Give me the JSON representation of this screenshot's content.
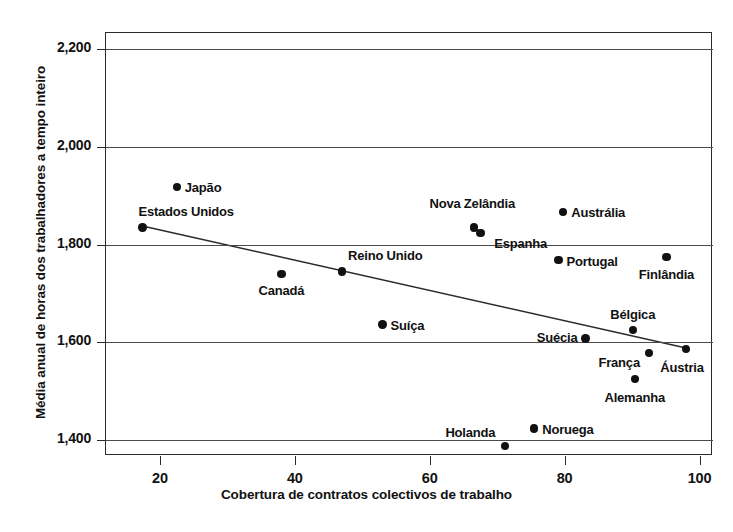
{
  "chart_data": {
    "type": "scatter",
    "title": "",
    "xlabel": "Cobertura de contratos colectivos de trabalho",
    "ylabel": "Média anual de horas dos trabalhadores a tempo inteiro",
    "xlim": [
      12,
      102
    ],
    "ylim": [
      1368,
      2232
    ],
    "xticks": [
      20,
      40,
      60,
      80,
      100
    ],
    "xtick_labels": [
      "20",
      "40",
      "60",
      "80",
      "100"
    ],
    "yticks": [
      1400,
      1600,
      1800,
      2000,
      2200
    ],
    "ytick_labels": [
      "1,400",
      "1,600",
      "1,800",
      "2,000",
      "2,200"
    ],
    "grid": "horizontal",
    "legend": "none",
    "point_color": "#111111",
    "line_color": "#2b2b2b",
    "points": [
      {
        "label": "Japão",
        "x": 22.5,
        "y": 1918,
        "label_pos": "r"
      },
      {
        "label": "Estados Unidos",
        "x": 17.4,
        "y": 1835,
        "label_pos": "r"
      },
      {
        "label": "Canadá",
        "x": 38.0,
        "y": 1740,
        "label_pos": "c"
      },
      {
        "label": "Reino Unido",
        "x": 47.0,
        "y": 1745,
        "label_pos": "r"
      },
      {
        "label": "Suíça",
        "x": 53.0,
        "y": 1637,
        "label_pos": "r"
      },
      {
        "label": "Nova Zelândia",
        "x": 66.6,
        "y": 1835,
        "label_pos": "c"
      },
      {
        "label": "Espanha",
        "x": 67.5,
        "y": 1823,
        "label_pos": "r"
      },
      {
        "label": "Holanda",
        "x": 71.2,
        "y": 1388,
        "label_pos": "l"
      },
      {
        "label": "Noruega",
        "x": 75.5,
        "y": 1424,
        "label_pos": "r"
      },
      {
        "label": "Portugal",
        "x": 79.1,
        "y": 1768,
        "label_pos": "r"
      },
      {
        "label": "Austrália",
        "x": 79.8,
        "y": 1866,
        "label_pos": "r"
      },
      {
        "label": "Suécia",
        "x": 83.1,
        "y": 1608,
        "label_pos": "l"
      },
      {
        "label": "Alemanha",
        "x": 90.4,
        "y": 1525,
        "label_pos": "c"
      },
      {
        "label": "Bélgica",
        "x": 90.1,
        "y": 1626,
        "label_pos": "c"
      },
      {
        "label": "França",
        "x": 92.5,
        "y": 1578,
        "label_pos": "l"
      },
      {
        "label": "Finlândia",
        "x": 95.1,
        "y": 1775,
        "label_pos": "c"
      },
      {
        "label": "Áustria",
        "x": 98.0,
        "y": 1587,
        "label_pos": "c"
      }
    ],
    "trendline": {
      "x0": 17.4,
      "y0": 1838,
      "x1": 98.5,
      "y1": 1587
    }
  },
  "caption": ""
}
